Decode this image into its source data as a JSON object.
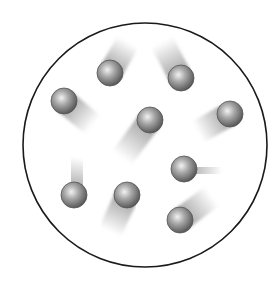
{
  "diagram": {
    "title": "",
    "container": {
      "shape": "circle",
      "cx": 145,
      "cy": 145,
      "r": 122,
      "stroke": "#1a1a1a",
      "stroke_width": 1.6
    },
    "particle_radius": 13,
    "colors": {
      "particle_light": "#f2f2f2",
      "particle_mid": "#a6a6a6",
      "particle_dark": "#5a5a5a",
      "particle_outline": "#555555",
      "trail": "#8a8a8a"
    },
    "particles": [
      {
        "x": 110,
        "y": 73,
        "tx": 128,
        "ty": 42
      },
      {
        "x": 181,
        "y": 78,
        "tx": 162,
        "ty": 42
      },
      {
        "x": 64,
        "y": 101,
        "tx": 93,
        "ty": 125
      },
      {
        "x": 150,
        "y": 120,
        "tx": 122,
        "ty": 158
      },
      {
        "x": 230,
        "y": 114,
        "tx": 198,
        "ty": 132
      },
      {
        "x": 74,
        "y": 195,
        "tx": 80,
        "ty": 158
      },
      {
        "x": 127,
        "y": 195,
        "tx": 110,
        "ty": 232
      },
      {
        "x": 184,
        "y": 169,
        "tx": 222,
        "ty": 172
      },
      {
        "x": 180,
        "y": 220,
        "tx": 212,
        "ty": 196
      }
    ]
  }
}
